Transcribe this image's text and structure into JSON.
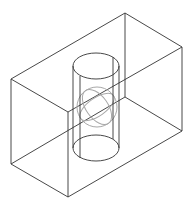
{
  "diagram": {
    "type": "wireframe-3d",
    "colors": {
      "background": "#ffffff",
      "edge": "#333333",
      "sphere": "#a8a8a8"
    },
    "box": {
      "vertices": {
        "top_back": [
          125,
          13
        ],
        "top_left": [
          11,
          79
        ],
        "top_front": [
          68,
          112
        ],
        "top_right": [
          182,
          47
        ],
        "bottom_back": [
          125,
          97
        ],
        "bottom_left": [
          11,
          164
        ],
        "bottom_front": [
          68,
          197
        ],
        "bottom_right": [
          182,
          131
        ]
      }
    },
    "cylinder": {
      "top_ellipse": {
        "cx": 96,
        "cy": 66,
        "rx": 23,
        "ry": 13
      },
      "bottom_ellipse": {
        "cx": 96,
        "cy": 148,
        "rx": 23,
        "ry": 13
      },
      "inner_lines_x": [
        80,
        113
      ]
    },
    "sphere": {
      "cx": 97,
      "cy": 107,
      "r": 20
    }
  }
}
